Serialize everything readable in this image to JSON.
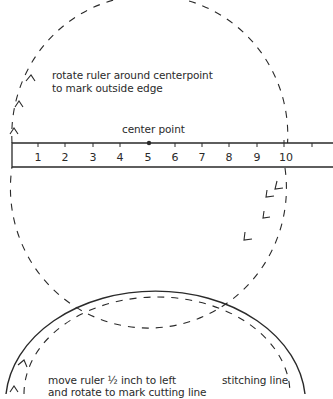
{
  "diagram": {
    "upper": {
      "instruction_lines": [
        "rotate ruler around centerpoint",
        "to mark outside edge"
      ],
      "center_label": "center point"
    },
    "ruler": {
      "numbers": [
        "1",
        "2",
        "3",
        "4",
        "5",
        "6",
        "7",
        "8",
        "9",
        "10"
      ],
      "center_mark_at": "5"
    },
    "lower": {
      "instruction_lines": [
        "move ruler ½ inch to left",
        "and rotate to mark cutting line"
      ],
      "stitching_label": "stitching line"
    },
    "colors": {
      "line": "#2a2a2a",
      "background": "#ffffff"
    }
  }
}
